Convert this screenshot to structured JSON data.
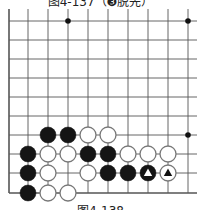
{
  "captions": {
    "top": "图4-137（❸脱先）",
    "bottom": "图4-138"
  },
  "board": {
    "columns_x": [
      9,
      28,
      48,
      68,
      88,
      108,
      128,
      148,
      168,
      188
    ],
    "rows_y": [
      21,
      40,
      59,
      78,
      97,
      116,
      135,
      154,
      173,
      193
    ],
    "right_extent": 197,
    "top_extent": 21,
    "left_edge": true,
    "bottom_edge": true,
    "line_color": "#555555",
    "star_points": [
      [
        3,
        0
      ],
      [
        9,
        0
      ],
      [
        9,
        6
      ]
    ],
    "stones": [
      {
        "col": 2,
        "row": 6,
        "color": "black"
      },
      {
        "col": 3,
        "row": 6,
        "color": "black"
      },
      {
        "col": 4,
        "row": 6,
        "color": "white"
      },
      {
        "col": 5,
        "row": 6,
        "color": "white"
      },
      {
        "col": 1,
        "row": 7,
        "color": "black"
      },
      {
        "col": 2,
        "row": 7,
        "color": "white"
      },
      {
        "col": 3,
        "row": 7,
        "color": "white"
      },
      {
        "col": 4,
        "row": 7,
        "color": "black"
      },
      {
        "col": 5,
        "row": 7,
        "color": "black"
      },
      {
        "col": 6,
        "row": 7,
        "color": "white"
      },
      {
        "col": 7,
        "row": 7,
        "color": "white"
      },
      {
        "col": 8,
        "row": 7,
        "color": "white"
      },
      {
        "col": 1,
        "row": 8,
        "color": "black"
      },
      {
        "col": 2,
        "row": 8,
        "color": "white"
      },
      {
        "col": 4,
        "row": 8,
        "color": "white"
      },
      {
        "col": 5,
        "row": 8,
        "color": "black"
      },
      {
        "col": 6,
        "row": 8,
        "color": "black"
      },
      {
        "col": 7,
        "row": 8,
        "color": "black",
        "mark": "triangle"
      },
      {
        "col": 8,
        "row": 8,
        "color": "white",
        "mark": "triangle"
      },
      {
        "col": 1,
        "row": 9,
        "color": "black"
      },
      {
        "col": 2,
        "row": 9,
        "color": "white"
      },
      {
        "col": 3,
        "row": 9,
        "color": "white"
      }
    ]
  }
}
